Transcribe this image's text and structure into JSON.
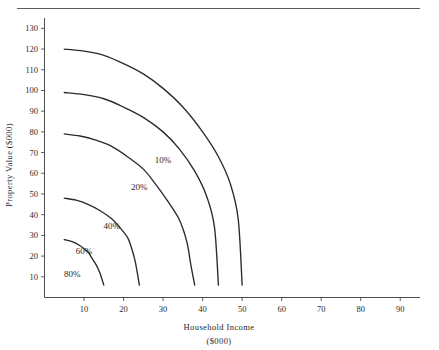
{
  "chart_data": {
    "type": "line",
    "title": "",
    "xlabel": "Household Income",
    "xlabel_units": "($000)",
    "ylabel": "Property Value ($000)",
    "xlim": [
      0,
      95
    ],
    "ylim": [
      0,
      135
    ],
    "grid": false,
    "legend": "inline-curve-labels",
    "x_ticks": [
      10,
      20,
      30,
      40,
      50,
      60,
      70,
      80,
      90
    ],
    "y_ticks": [
      10,
      20,
      30,
      40,
      50,
      60,
      70,
      80,
      90,
      100,
      110,
      120,
      130
    ],
    "series": [
      {
        "name": "10%",
        "label": "10%",
        "y_intercept": 120,
        "x_intercept": 50,
        "label_x": 30,
        "label_y": 65,
        "points": [
          [
            5,
            120
          ],
          [
            10,
            119
          ],
          [
            15,
            117
          ],
          [
            20,
            113
          ],
          [
            25,
            108
          ],
          [
            30,
            101
          ],
          [
            35,
            92
          ],
          [
            40,
            80
          ],
          [
            44,
            68
          ],
          [
            47,
            55
          ],
          [
            49,
            38
          ],
          [
            50,
            6
          ]
        ]
      },
      {
        "name": "20%",
        "label": "20%",
        "y_intercept": 99,
        "x_intercept": 44,
        "label_x": 24,
        "label_y": 52,
        "points": [
          [
            5,
            99
          ],
          [
            10,
            98
          ],
          [
            15,
            96
          ],
          [
            20,
            92
          ],
          [
            25,
            87
          ],
          [
            30,
            80
          ],
          [
            34,
            72
          ],
          [
            38,
            61
          ],
          [
            41,
            49
          ],
          [
            43,
            34
          ],
          [
            44,
            6
          ]
        ]
      },
      {
        "name": "40%",
        "label": "40%",
        "y_intercept": 79,
        "x_intercept": 38,
        "label_x": 17,
        "label_y": 33,
        "points": [
          [
            5,
            79
          ],
          [
            9,
            78
          ],
          [
            13,
            76
          ],
          [
            17,
            73
          ],
          [
            21,
            68
          ],
          [
            25,
            62
          ],
          [
            28,
            55
          ],
          [
            31,
            47
          ],
          [
            34,
            38
          ],
          [
            36,
            27
          ],
          [
            37,
            16
          ],
          [
            38,
            6
          ]
        ]
      },
      {
        "name": "60%",
        "label": "60%",
        "y_intercept": 48,
        "x_intercept": 24,
        "label_x": 10,
        "label_y": 21,
        "points": [
          [
            5,
            48
          ],
          [
            8,
            47
          ],
          [
            11,
            45
          ],
          [
            14,
            42
          ],
          [
            17,
            38
          ],
          [
            19,
            34
          ],
          [
            21,
            29
          ],
          [
            22,
            24
          ],
          [
            23,
            17
          ],
          [
            24,
            6
          ]
        ]
      },
      {
        "name": "80%",
        "label": "80%",
        "y_intercept": 28,
        "x_intercept": 15,
        "label_x": 7,
        "label_y": 10,
        "points": [
          [
            5,
            28
          ],
          [
            7,
            27
          ],
          [
            9,
            25
          ],
          [
            11,
            22
          ],
          [
            12,
            19
          ],
          [
            13,
            16
          ],
          [
            14,
            12
          ],
          [
            15,
            6
          ]
        ]
      }
    ]
  }
}
